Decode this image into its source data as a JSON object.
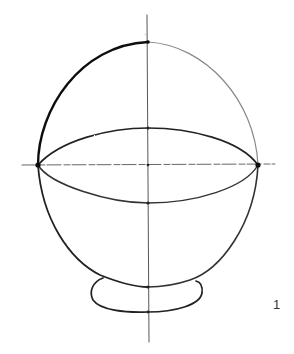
{
  "figure": {
    "number_label": "1",
    "colors": {
      "ink": "#1a1a1a",
      "light_ink": "#777777",
      "background": "#ffffff"
    }
  }
}
